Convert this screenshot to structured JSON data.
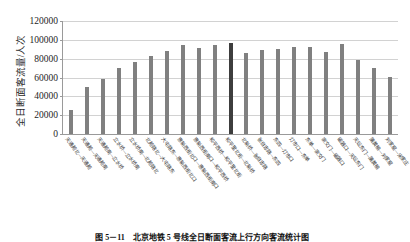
{
  "figure": {
    "caption": "图 5－11　北京地铁 5 号线全日断面客流上行方向客流统计图",
    "ylabel": "全日断面客流量/人次"
  },
  "chart_data": {
    "type": "bar",
    "title": "",
    "xlabel": "",
    "ylabel": "全日断面客流量/人次",
    "ylim": [
      0,
      120000
    ],
    "ytick_labels": [
      "120000",
      "100000",
      "80000",
      "60000",
      "40000",
      "20000",
      "0"
    ],
    "ytick_values": [
      120000,
      100000,
      80000,
      60000,
      40000,
      20000,
      0
    ],
    "grid": true,
    "legend": "none",
    "highlight_index": 10,
    "highlight_color": "#3d3d3d",
    "bar_color": "#808080",
    "categories": [
      "天通苑北—天通苑",
      "天通苑—天通苑南",
      "天通苑南—立水桥",
      "立水桥—立水桥南",
      "立水桥南—北苑路北",
      "北苑路北—大屯路东",
      "大屯路东—惠新西街北口",
      "惠新西街北口—惠新西街南口",
      "惠新西街南口—和平西桥",
      "和平西桥—和平里北街",
      "和平里北街—北新桥",
      "北新桥—张自忠路",
      "张自忠路—东四",
      "东四—灯市口",
      "灯市口—东单",
      "东单—崇文门",
      "崇文门—磁器口",
      "磁器口—天坛东门",
      "天坛东门—蒲黄榆",
      "蒲黄榆—刘家窑",
      "刘家窑—宋家庄"
    ],
    "values": [
      26000,
      49500,
      58000,
      70500,
      77000,
      82500,
      88000,
      95000,
      91000,
      94000,
      97000,
      86000,
      89000,
      90000,
      92000,
      92000,
      87000,
      95500,
      79000,
      70500,
      61000
    ]
  }
}
